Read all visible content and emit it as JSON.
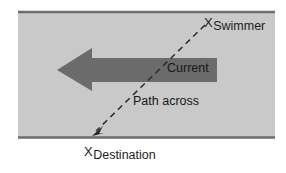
{
  "diagram": {
    "river": {
      "fill_color": "#c9c9c9",
      "border_color": "#6f6f6f"
    },
    "current_arrow": {
      "label": "Current",
      "color": "#6b6b6b",
      "direction": "left"
    },
    "path": {
      "label": "Path across",
      "style": "dashed",
      "color": "#2a2a2a",
      "direction": "from-swimmer-to-destination"
    },
    "points": [
      {
        "marker": "X",
        "label": "Swimmer",
        "position": "top-right"
      },
      {
        "marker": "X",
        "label": "Destination",
        "position": "bottom-left"
      }
    ]
  }
}
